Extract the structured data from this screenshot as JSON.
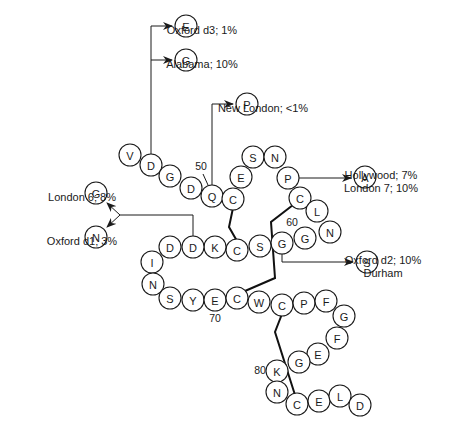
{
  "diagram": {
    "residues": [
      {
        "aa": "V",
        "x": 130,
        "y": 155
      },
      {
        "aa": "D",
        "x": 151,
        "y": 165
      },
      {
        "aa": "G",
        "x": 170,
        "y": 176
      },
      {
        "aa": "D",
        "x": 191,
        "y": 188
      },
      {
        "aa": "Q",
        "x": 212,
        "y": 196
      },
      {
        "aa": "C",
        "x": 233,
        "y": 199
      },
      {
        "aa": "E",
        "x": 241,
        "y": 177
      },
      {
        "aa": "S",
        "x": 253,
        "y": 157
      },
      {
        "aa": "N",
        "x": 275,
        "y": 157
      },
      {
        "aa": "P",
        "x": 288,
        "y": 178
      },
      {
        "aa": "C",
        "x": 300,
        "y": 198
      },
      {
        "aa": "L",
        "x": 317,
        "y": 211
      },
      {
        "aa": "N",
        "x": 330,
        "y": 232
      },
      {
        "aa": "G",
        "x": 305,
        "y": 238
      },
      {
        "aa": "G",
        "x": 282,
        "y": 243
      },
      {
        "aa": "S",
        "x": 260,
        "y": 246
      },
      {
        "aa": "C",
        "x": 237,
        "y": 250
      },
      {
        "aa": "K",
        "x": 215,
        "y": 247
      },
      {
        "aa": "D",
        "x": 193,
        "y": 247
      },
      {
        "aa": "D",
        "x": 170,
        "y": 247
      },
      {
        "aa": "I",
        "x": 152,
        "y": 262
      },
      {
        "aa": "N",
        "x": 153,
        "y": 284
      },
      {
        "aa": "S",
        "x": 170,
        "y": 298
      },
      {
        "aa": "Y",
        "x": 193,
        "y": 300
      },
      {
        "aa": "E",
        "x": 215,
        "y": 300
      },
      {
        "aa": "C",
        "x": 237,
        "y": 298
      },
      {
        "aa": "W",
        "x": 259,
        "y": 302
      },
      {
        "aa": "C",
        "x": 282,
        "y": 305
      },
      {
        "aa": "P",
        "x": 304,
        "y": 303
      },
      {
        "aa": "F",
        "x": 326,
        "y": 301
      },
      {
        "aa": "G",
        "x": 344,
        "y": 316
      },
      {
        "aa": "F",
        "x": 337,
        "y": 338
      },
      {
        "aa": "E",
        "x": 318,
        "y": 354
      },
      {
        "aa": "G",
        "x": 299,
        "y": 362
      },
      {
        "aa": "K",
        "x": 277,
        "y": 371
      },
      {
        "aa": "N",
        "x": 277,
        "y": 392
      },
      {
        "aa": "C",
        "x": 297,
        "y": 404
      },
      {
        "aa": "E",
        "x": 319,
        "y": 401
      },
      {
        "aa": "L",
        "x": 340,
        "y": 396
      },
      {
        "aa": "D",
        "x": 360,
        "y": 405
      }
    ],
    "position_labels": [
      {
        "text": "50",
        "x": 201,
        "y": 170
      },
      {
        "text": "60",
        "x": 292,
        "y": 226
      },
      {
        "text": "70",
        "x": 215,
        "y": 322
      },
      {
        "text": "80",
        "x": 260,
        "y": 374
      }
    ],
    "variants": [
      {
        "aa": "E",
        "x": 186,
        "y": 26,
        "label_lines": [
          "Oxford d3; 1%"
        ],
        "label_x": 202,
        "label_y": 26,
        "anchor": "start"
      },
      {
        "aa": "G",
        "x": 186,
        "y": 60,
        "label_lines": [
          "Alabama; 10%"
        ],
        "label_x": 202,
        "label_y": 60,
        "anchor": "start"
      },
      {
        "aa": "P",
        "x": 247,
        "y": 104,
        "label_lines": [
          "New London; <1%"
        ],
        "label_x": 263,
        "label_y": 104,
        "anchor": "start"
      },
      {
        "aa": "A",
        "x": 365,
        "y": 177,
        "label_lines": [
          "Hollywood; 7%",
          "London 7; 10%"
        ],
        "label_x": 381,
        "label_y": 171,
        "anchor": "start"
      },
      {
        "aa": "S",
        "x": 367,
        "y": 262,
        "label_lines": [
          "Oxford d2; 10%",
          "Durham"
        ],
        "label_x": 383,
        "label_y": 256,
        "anchor": "start"
      },
      {
        "aa": "G",
        "x": 96,
        "y": 193,
        "label_lines": [
          "London 6; 8%"
        ],
        "label_x": 82,
        "label_y": 193,
        "anchor": "end"
      },
      {
        "aa": "N",
        "x": 96,
        "y": 237,
        "label_lines": [
          "Oxford d1; 3%"
        ],
        "label_x": 82,
        "label_y": 237,
        "anchor": "end"
      }
    ]
  }
}
